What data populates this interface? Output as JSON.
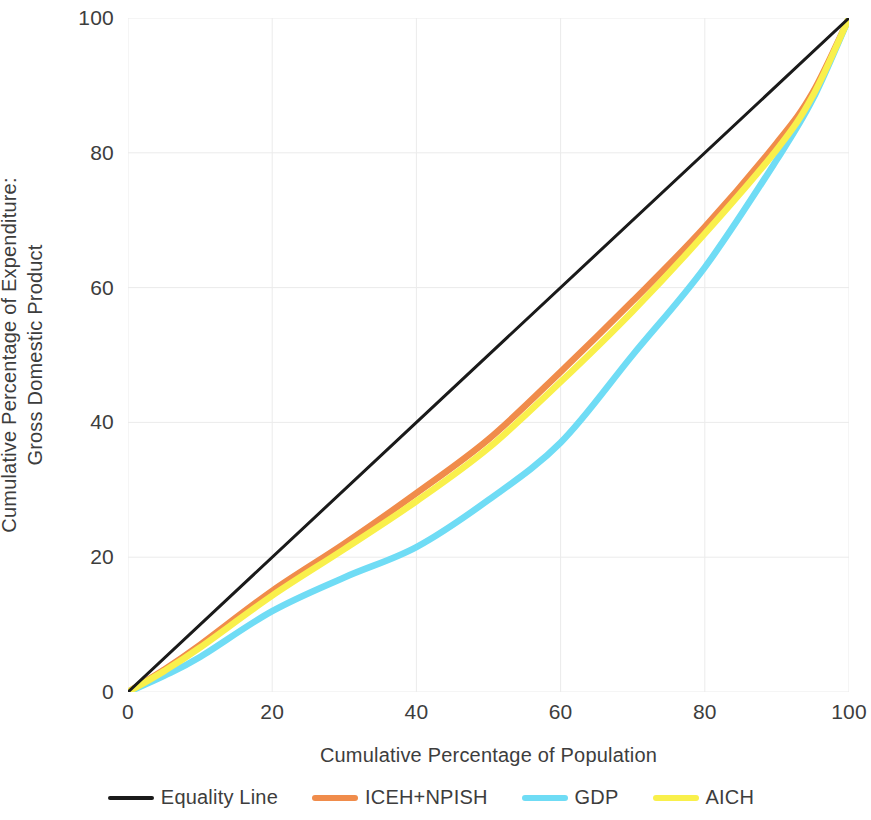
{
  "chart_data": {
    "type": "line",
    "title": "",
    "xlabel": "Cumulative Percentage of Population",
    "ylabel_lines": [
      "Cumulative Percentage of Expenditure:",
      "Gross Domestic Product"
    ],
    "ylabel": "Cumulative Percentage of Expenditure: Gross Domestic Product",
    "xlim": [
      0,
      100
    ],
    "ylim": [
      0,
      100
    ],
    "xticks": [
      "0",
      "20",
      "40",
      "60",
      "80",
      "100"
    ],
    "yticks": [
      "0",
      "20",
      "40",
      "60",
      "80",
      "100"
    ],
    "xtick_values": [
      0,
      20,
      40,
      60,
      80,
      100
    ],
    "ytick_values": [
      0,
      20,
      40,
      60,
      80,
      100
    ],
    "grid": true,
    "legend_position": "bottom",
    "x": [
      0,
      5,
      10,
      20,
      30,
      40,
      50,
      60,
      70,
      80,
      90,
      95,
      100
    ],
    "series": [
      {
        "name": "Equality Line",
        "color": "#1a1a1a",
        "values": [
          0,
          5,
          10,
          20,
          30,
          40,
          50,
          60,
          70,
          80,
          90,
          95,
          100
        ]
      },
      {
        "name": "ICEH+NPISH",
        "color": "#F08C4B",
        "values": [
          0,
          3.3,
          7.0,
          15.0,
          22.0,
          29.5,
          37.5,
          47.5,
          58.0,
          69.0,
          81.5,
          89.0,
          100
        ]
      },
      {
        "name": "GDP",
        "color": "#6FDCF5",
        "values": [
          0,
          2.4,
          5.2,
          12.0,
          17.0,
          21.5,
          28.5,
          37.0,
          50.0,
          63.0,
          79.0,
          88.0,
          100
        ]
      },
      {
        "name": "AICH",
        "color": "#F9F04B",
        "values": [
          0,
          3.1,
          6.6,
          14.3,
          21.2,
          28.3,
          36.2,
          46.0,
          56.5,
          68.0,
          80.5,
          88.5,
          100
        ]
      }
    ]
  },
  "legend": {
    "items": [
      {
        "label": "Equality Line",
        "color": "#1a1a1a",
        "style": "thin"
      },
      {
        "label": "ICEH+NPISH",
        "color": "#F08C4B",
        "style": "thick"
      },
      {
        "label": "GDP",
        "color": "#6FDCF5",
        "style": "thick"
      },
      {
        "label": "AICH",
        "color": "#F9F04B",
        "style": "thick"
      }
    ]
  },
  "colors": {
    "equality_line": "#1a1a1a",
    "iceh_npish": "#F08C4B",
    "gdp": "#6FDCF5",
    "aich": "#F9F04B",
    "grid": "#ebebeb",
    "text": "#3d3d3d",
    "background": "#ffffff"
  }
}
